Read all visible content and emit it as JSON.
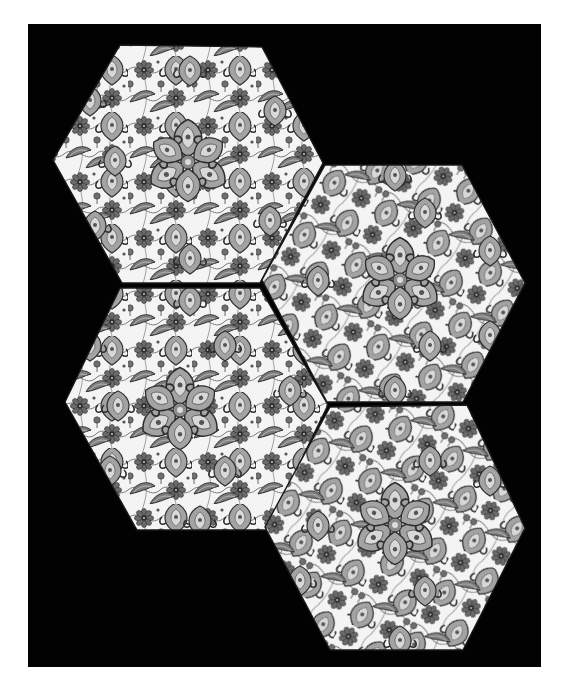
{
  "image": {
    "description": "Photograph of four hexagonal glazed ceramic tiles with dense floral (rosette, palmette, saz-leaf) decoration, arranged in an offset cluster on a black background; grayscale reproduction",
    "background_color": "#000000",
    "margin_color": "#ffffff",
    "tile_ground_color": "#f4f4f4",
    "rosette_color": "#555555",
    "leaf_color": "#9a9a9a",
    "outline_color": "#2a2a2a"
  },
  "backdrop": {
    "x": 28,
    "y": 24,
    "width": 513,
    "height": 643
  },
  "tiles": [
    {
      "id": "tile-top-left",
      "points": "120,45 262,47 323,163 260,283 122,283 53,160"
    },
    {
      "id": "tile-top-right",
      "points": "325,165 462,165 525,283 463,402 327,402 262,280"
    },
    {
      "id": "tile-bottom-left",
      "points": "120,288 260,288 328,405 267,530 137,530 65,402"
    },
    {
      "id": "tile-bottom-right",
      "points": "330,407 467,405 525,528 463,650 330,650 265,527"
    }
  ]
}
